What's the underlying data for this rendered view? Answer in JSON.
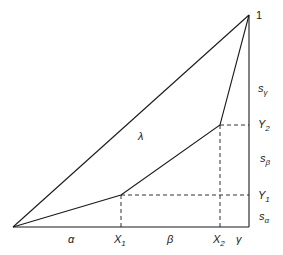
{
  "diagram": {
    "type": "geometric-partition-triangle",
    "colors": {
      "line": "#1a1a1a",
      "background": "#ffffff"
    },
    "points": {
      "origin": [
        13,
        227
      ],
      "top": [
        249,
        15
      ],
      "p1": [
        121,
        195
      ],
      "p2": [
        220,
        125
      ],
      "bottom_right": [
        249,
        227
      ]
    },
    "labels": {
      "top": "1",
      "lambda": "λ",
      "s_gamma": "s",
      "s_gamma_sub": "γ",
      "y2": "Y",
      "y2_sub": "2",
      "s_beta": "s",
      "s_beta_sub": "β",
      "y1": "Y",
      "y1_sub": "1",
      "s_alpha": "s",
      "s_alpha_sub": "α",
      "alpha": "α",
      "x1": "X",
      "x1_sub": "1",
      "beta": "β",
      "x2": "X",
      "x2_sub": "2",
      "gamma": "γ"
    }
  }
}
